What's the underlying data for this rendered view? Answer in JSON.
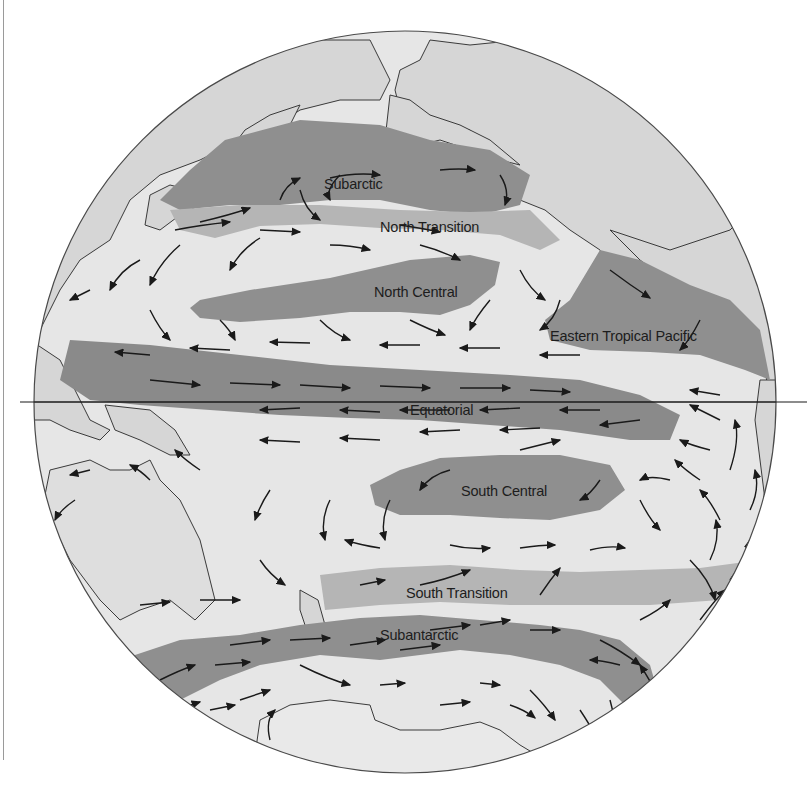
{
  "map": {
    "type": "orthographic-globe",
    "subject": "Pacific Ocean biogeographic provinces and surface currents",
    "colors": {
      "background": "#ffffff",
      "ocean": "#e6e6e6",
      "land": "#d3d3d3",
      "land_outline": "#3a3a3a",
      "province_dark": "#8c8c8c",
      "province_medium": "#a9a9a9",
      "transition": "#c2c2c2",
      "arrow": "#1a1a1a",
      "equator": "#1a1a1a",
      "text": "#1d1d1d"
    },
    "regions": [
      {
        "id": "subarctic",
        "label": "Subarctic"
      },
      {
        "id": "north-transition",
        "label": "North Transition"
      },
      {
        "id": "north-central",
        "label": "North Central"
      },
      {
        "id": "eastern-tropical-pacific",
        "label": "Eastern Tropical Pacific"
      },
      {
        "id": "equatorial",
        "label": "Equatorial"
      },
      {
        "id": "south-central",
        "label": "South Central"
      },
      {
        "id": "south-transition",
        "label": "South Transition"
      },
      {
        "id": "subantarctic",
        "label": "Subantarctic"
      }
    ],
    "equator_line": true,
    "current_arrows": true
  }
}
